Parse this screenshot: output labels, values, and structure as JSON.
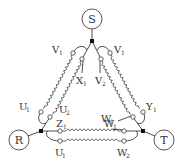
{
  "diagram": {
    "type": "three-phase winding connection diagram",
    "sources": [
      {
        "id": "S",
        "label": "S",
        "cx": 92,
        "cy": 19
      },
      {
        "id": "R",
        "label": "R",
        "cx": 19,
        "cy": 140
      },
      {
        "id": "T",
        "label": "T",
        "cx": 164,
        "cy": 140
      }
    ],
    "junctions": [
      {
        "id": "jS",
        "x": 92,
        "y": 41
      },
      {
        "id": "jR",
        "x": 41,
        "y": 131
      },
      {
        "id": "jT",
        "x": 143,
        "y": 131
      }
    ],
    "terminals": {
      "left_V1": {
        "main": "V",
        "sub": "1"
      },
      "left_X1": {
        "main": "X",
        "sub": "1"
      },
      "left_U1": {
        "main": "U",
        "sub": "1"
      },
      "left_U2": {
        "main": "U",
        "sub": "2"
      },
      "right_V1": {
        "main": "V",
        "sub": "1"
      },
      "right_V2": {
        "main": "V",
        "sub": "2"
      },
      "right_Y1": {
        "main": "Y",
        "sub": "1"
      },
      "right_W1": {
        "main": "W",
        "sub": "1"
      },
      "bottom_Z1": {
        "main": "Z",
        "sub": "1"
      },
      "bottom_U1": {
        "main": "U",
        "sub": "1"
      },
      "bottom_W1": {
        "main": "W",
        "sub": "1"
      },
      "bottom_W2": {
        "main": "W",
        "sub": "2"
      }
    },
    "colors": {
      "line": "#3a3a3a",
      "node": "#111111",
      "text": "#333333"
    }
  }
}
